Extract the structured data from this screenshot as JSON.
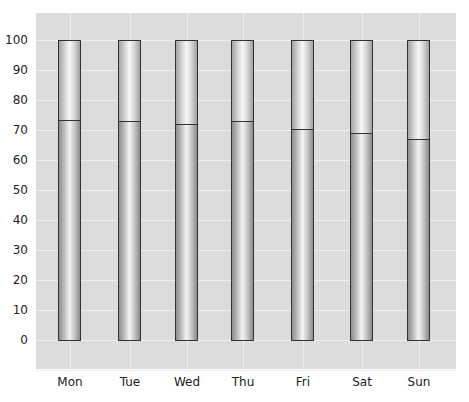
{
  "chart_data": {
    "type": "bar",
    "subtype": "stacked-100-percent",
    "title": "",
    "xlabel": "",
    "ylabel": "",
    "categories": [
      "Mon",
      "Tue",
      "Wed",
      "Thu",
      "Fri",
      "Sat",
      "Sun"
    ],
    "series": [
      {
        "name": "lower",
        "values": [
          73.4,
          73,
          72,
          73,
          70.3,
          69,
          67
        ]
      },
      {
        "name": "upper",
        "values": [
          26.6,
          27,
          28,
          27,
          29.7,
          31,
          33
        ]
      }
    ],
    "ylim": [
      -10,
      108
    ],
    "yticks": [
      "0",
      "10",
      "20",
      "30",
      "40",
      "50",
      "60",
      "70",
      "80",
      "90",
      "100"
    ],
    "grid": true,
    "legend": "none",
    "colors": {
      "plot_bg": "#dcdcdc",
      "grid": "#efefef",
      "bar_outline": "#333333"
    }
  }
}
